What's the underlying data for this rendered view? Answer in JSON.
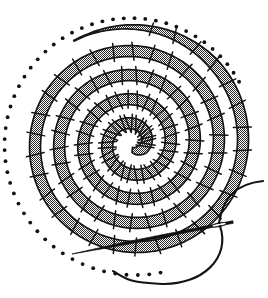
{
  "figure": {
    "title": "Coiled spiral with stitching and threaded needle",
    "caption": "",
    "background_color": "#ffffff",
    "ink_color": "#161616",
    "fill_pattern": "halftone-checkerboard-dots",
    "fill_tone_color": "#2b2b2b",
    "canvas": {
      "width": 268,
      "height": 298
    }
  },
  "spiral": {
    "name": "coiled-spiral-band",
    "center": {
      "x": 133,
      "y": 143
    },
    "turns": 4.6,
    "start_radius": 7,
    "end_radius": 118,
    "band_width": 11,
    "start_angle_deg": 96,
    "direction": "counterclockwise-outward",
    "outer_end_point": {
      "x": 181,
      "y": 37
    },
    "outer_end_taper": true,
    "stroke_width": 1.7,
    "turn_gap": 13
  },
  "stitches": {
    "name": "stitch-tick-marks",
    "count": 128,
    "length": 7,
    "stroke_width": 1.5,
    "orientation": "perpendicular-to-band",
    "description": "short tick marks crossing the band edges"
  },
  "guide_dots": {
    "name": "outer-guide-dot-arc",
    "count": 52,
    "radius_px": 1.9,
    "offset_from_band": 9,
    "arc_start_angle_deg": 78,
    "arc_end_angle_deg": 330,
    "color": "#111111"
  },
  "needle": {
    "name": "sewing-needle",
    "tip": {
      "x": 72,
      "y": 254
    },
    "eye_center": {
      "x": 219,
      "y": 224
    },
    "butt": {
      "x": 233,
      "y": 222
    },
    "length": 162,
    "angle_deg": -10.5,
    "eye_length": 14,
    "eye_width": 4,
    "color": "#111111"
  },
  "thread": {
    "name": "thread-strand",
    "color": "#131313",
    "stroke_width": 2.1,
    "upper_end": {
      "x": 263,
      "y": 181
    },
    "lower_end": {
      "x": 113,
      "y": 271
    },
    "loop_bottom": {
      "x": 196,
      "y": 285
    },
    "passes_through_eye": true
  }
}
